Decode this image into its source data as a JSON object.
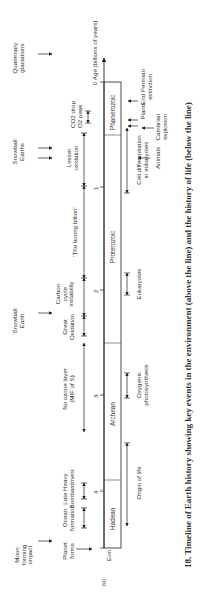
{
  "page_number": "60",
  "caption": "18.  Timeline of Earth history showing key events in the environment (above the line) and the history of life (below the line)",
  "axis": {
    "label": "0 Age (billions of years)",
    "eon_label": "Eon",
    "ticks": [
      "4",
      "3",
      "2",
      "1",
      "0"
    ]
  },
  "eons": [
    {
      "name": "Hadean",
      "start_ga": 4.55,
      "end_ga": 4.0
    },
    {
      "name": "Archean",
      "start_ga": 4.0,
      "end_ga": 2.5
    },
    {
      "name": "Proterozoic",
      "start_ga": 2.5,
      "end_ga": 0.54
    },
    {
      "name": "Phanerozoic",
      "start_ga": 0.54,
      "end_ga": 0
    }
  ],
  "environment_events": {
    "far": [
      {
        "label": "Moon\nforming\nimpact"
      },
      {
        "label": "Snowball\nEarth"
      },
      {
        "label": "Snowball\nEarths"
      },
      {
        "label": "Quaternary\nglaciations"
      }
    ],
    "near": [
      {
        "label": "Planet\nforms"
      },
      {
        "label": "Ocean\nformation"
      },
      {
        "label": "Late Heavy\nBombardment"
      },
      {
        "label": "No ozone layer\n(MIF of S)"
      },
      {
        "label": "Great\nOxidation"
      },
      {
        "label": "Carbon\ncycle\ninstability"
      },
      {
        "label": "'The boring billion'"
      },
      {
        "label": "Lesser\noxidation"
      },
      {
        "label": "CO2 drop"
      },
      {
        "label": "O2 peak"
      }
    ]
  },
  "life_events": [
    {
      "label": "Origin of life"
    },
    {
      "label": "Oxygenic\nphotosynthesis"
    },
    {
      "label": "Eukaryotes"
    },
    {
      "label": "Cell differentiation\nin eukaryotes"
    },
    {
      "label": "Animals"
    },
    {
      "label": "Cambrian\nexplosion"
    },
    {
      "label": "Plants"
    },
    {
      "label": "End Permian\nextinction"
    }
  ]
}
